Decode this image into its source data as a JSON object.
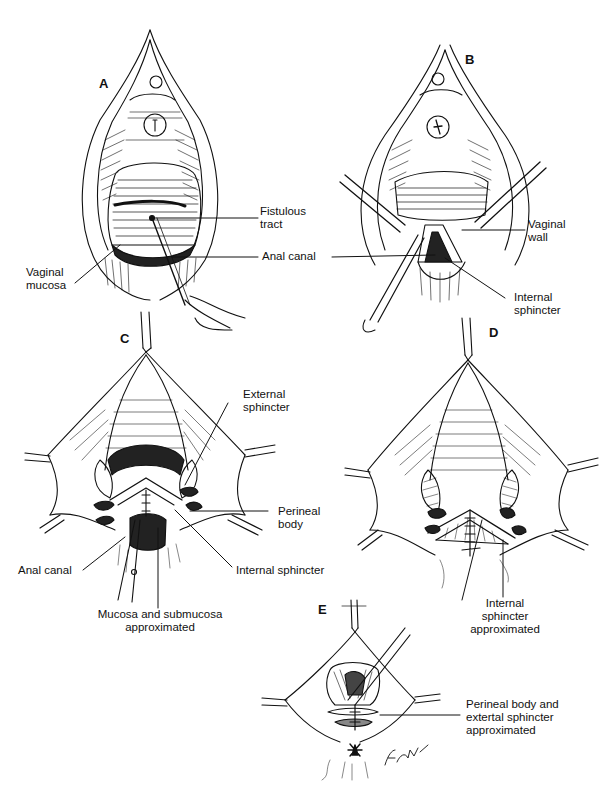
{
  "figure": {
    "panels": [
      {
        "id": "A",
        "letter": "A",
        "labels": [
          {
            "key": "fistulous_tract",
            "lines": [
              "Fistulous",
              "tract"
            ]
          },
          {
            "key": "anal_canal",
            "lines": [
              "Anal canal"
            ]
          },
          {
            "key": "vaginal_mucosa",
            "lines": [
              "Vaginal",
              "mucosa"
            ]
          }
        ]
      },
      {
        "id": "B",
        "letter": "B",
        "labels": [
          {
            "key": "vaginal_wall",
            "lines": [
              "Vaginal",
              "wall"
            ]
          },
          {
            "key": "internal_sphincter",
            "lines": [
              "Internal",
              "sphincter"
            ]
          }
        ]
      },
      {
        "id": "C",
        "letter": "C",
        "labels": [
          {
            "key": "external_sphincter",
            "lines": [
              "External",
              "sphincter"
            ]
          },
          {
            "key": "perineal_body",
            "lines": [
              "Perineal",
              "body"
            ]
          },
          {
            "key": "anal_canal",
            "lines": [
              "Anal canal"
            ]
          },
          {
            "key": "internal_sphincter",
            "lines": [
              "Internal sphincter"
            ]
          },
          {
            "key": "mucosa_submucosa",
            "lines": [
              "Mucosa and submucosa",
              "approximated"
            ]
          }
        ]
      },
      {
        "id": "D",
        "letter": "D",
        "labels": [
          {
            "key": "internal_sphincter_approximated",
            "lines": [
              "Internal",
              "sphincter",
              "approximated"
            ]
          }
        ]
      },
      {
        "id": "E",
        "letter": "E",
        "labels": [
          {
            "key": "perineal_body_external_sphincter",
            "lines": [
              "Perineal body and",
              "extertal sphincter",
              "approximated"
            ]
          }
        ]
      }
    ],
    "signature": "Finch '79"
  }
}
